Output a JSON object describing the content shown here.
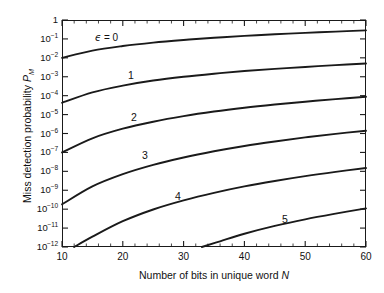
{
  "figure": {
    "background_color": "#ffffff",
    "line_color": "#1a1a1a",
    "axis_color": "#1a1a1a"
  },
  "axes": {
    "x": {
      "title_prefix": "Number of bits in unique word ",
      "title_symbol": "N",
      "ticks": [
        "10",
        "20",
        "30",
        "40",
        "50",
        "60"
      ],
      "minor_tick_count": 5
    },
    "y": {
      "title_prefix": "Miss detection probability ",
      "title_symbol": "P",
      "title_subscript": "M",
      "ticks": [
        {
          "mantissa": "1",
          "exponent": ""
        },
        {
          "mantissa": "10",
          "exponent": "−1"
        },
        {
          "mantissa": "10",
          "exponent": "−2"
        },
        {
          "mantissa": "10",
          "exponent": "−3"
        },
        {
          "mantissa": "10",
          "exponent": "−4"
        },
        {
          "mantissa": "10",
          "exponent": "−5"
        },
        {
          "mantissa": "10",
          "exponent": "−6"
        },
        {
          "mantissa": "10",
          "exponent": "−7"
        },
        {
          "mantissa": "10",
          "exponent": "−8"
        },
        {
          "mantissa": "10",
          "exponent": "−9"
        },
        {
          "mantissa": "10",
          "exponent": "−10"
        },
        {
          "mantissa": "10",
          "exponent": "−11"
        },
        {
          "mantissa": "10",
          "exponent": "−12"
        }
      ]
    }
  },
  "curve_labels": [
    {
      "text": "ϵ = 0",
      "x": 95,
      "y": 32,
      "is_eps": true
    },
    {
      "text": "1",
      "x": 128,
      "y": 70,
      "is_eps": false
    },
    {
      "text": "2",
      "x": 131,
      "y": 112,
      "is_eps": false
    },
    {
      "text": "3",
      "x": 142,
      "y": 150,
      "is_eps": false
    },
    {
      "text": "4",
      "x": 175,
      "y": 191,
      "is_eps": false
    },
    {
      "text": "5",
      "x": 282,
      "y": 214,
      "is_eps": false
    }
  ],
  "chart_data": {
    "type": "line",
    "title": "",
    "xlabel": "Number of bits in unique word N",
    "ylabel": "Miss detection probability P_M",
    "xscale": "linear",
    "yscale": "log",
    "xlim": [
      10,
      60
    ],
    "ylim": [
      1e-12,
      1
    ],
    "grid": false,
    "legend": "inline-curve-labels",
    "xticks": [
      10,
      20,
      30,
      40,
      50,
      60
    ],
    "yticks": [
      1,
      0.1,
      0.01,
      0.001,
      0.0001,
      1e-05,
      1e-06,
      1e-07,
      1e-08,
      1e-09,
      1e-10,
      1e-11,
      1e-12
    ],
    "series": [
      {
        "name": "ϵ = 0",
        "epsilon": 0,
        "x": [
          10,
          15,
          20,
          25,
          30,
          35,
          40,
          45,
          50,
          55,
          60
        ],
        "y": [
          0.01,
          0.024,
          0.042,
          0.064,
          0.088,
          0.115,
          0.144,
          0.175,
          0.208,
          0.244,
          0.282
        ]
      },
      {
        "name": "1",
        "epsilon": 1,
        "x": [
          10,
          15,
          20,
          25,
          30,
          35,
          40,
          45,
          50,
          55,
          60
        ],
        "y": [
          4.2e-05,
          0.00015,
          0.00034,
          0.00063,
          0.001,
          0.00145,
          0.002,
          0.0026,
          0.0033,
          0.0041,
          0.005
        ]
      },
      {
        "name": "2",
        "epsilon": 2,
        "x": [
          10,
          15,
          20,
          25,
          30,
          35,
          40,
          45,
          50,
          55,
          60
        ],
        "y": [
          1e-07,
          5.6e-07,
          1.8e-06,
          4.2e-06,
          8.3e-06,
          1.45e-05,
          2.3e-05,
          3.4e-05,
          4.8e-05,
          6.6e-05,
          8.7e-05
        ]
      },
      {
        "name": "3",
        "epsilon": 3,
        "x": [
          10,
          15,
          20,
          25,
          30,
          35,
          40,
          45,
          50,
          55,
          60
        ],
        "y": [
          1.8e-10,
          1.6e-09,
          7.1e-09,
          2.2e-08,
          5.4e-08,
          1.15e-07,
          2.2e-07,
          3.8e-07,
          6.2e-07,
          9.6e-07,
          1.4e-06
        ]
      },
      {
        "name": "4",
        "epsilon": 4,
        "x": [
          12,
          15,
          20,
          25,
          30,
          35,
          40,
          45,
          50,
          55,
          60
        ],
        "y": [
          1e-12,
          3.5e-12,
          2.3e-11,
          9.6e-11,
          2.9e-10,
          7.3e-10,
          1.6e-09,
          3.1e-09,
          5.6e-09,
          9.4e-09,
          1.5e-08
        ]
      },
      {
        "name": "5",
        "epsilon": 5,
        "x": [
          33,
          36,
          40,
          45,
          50,
          55,
          60
        ],
        "y": [
          1e-12,
          2e-12,
          5e-12,
          1.3e-11,
          2.9e-11,
          5.8e-11,
          1.1e-10
        ]
      }
    ]
  }
}
